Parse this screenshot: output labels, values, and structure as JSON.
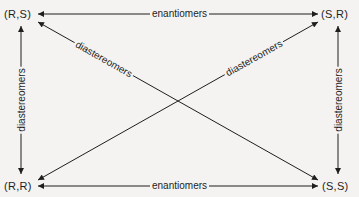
{
  "diagram": {
    "type": "stereoisomer-relationship-diagram",
    "nodes": [
      {
        "id": "rs",
        "label": "(R,S)",
        "position": "top-left"
      },
      {
        "id": "sr",
        "label": "(S,R)",
        "position": "top-right"
      },
      {
        "id": "rr",
        "label": "(R,R)",
        "position": "bottom-left"
      },
      {
        "id": "ss",
        "label": "(S,S)",
        "position": "bottom-right"
      }
    ],
    "edges": [
      {
        "from": "rs",
        "to": "sr",
        "label": "enantiomers",
        "direction": "both"
      },
      {
        "from": "rr",
        "to": "ss",
        "label": "enantiomers",
        "direction": "both"
      },
      {
        "from": "rs",
        "to": "rr",
        "label": "diastereomers",
        "direction": "both"
      },
      {
        "from": "sr",
        "to": "ss",
        "label": "diastereomers",
        "direction": "both"
      },
      {
        "from": "rs",
        "to": "ss",
        "label": "diastereomers",
        "direction": "both"
      },
      {
        "from": "rr",
        "to": "sr",
        "label": "diastereomers",
        "direction": "both"
      }
    ],
    "colors": {
      "line": "#1e1e1e",
      "background": "#f4f3f1"
    }
  }
}
